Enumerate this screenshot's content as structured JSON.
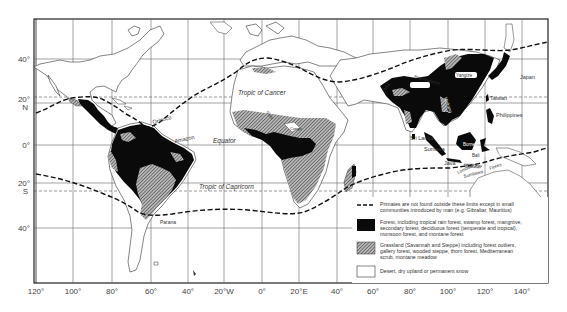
{
  "map": {
    "title": "World distribution of primates and vegetation zones",
    "colors": {
      "forest": "#0a0a0a",
      "grassland_hatch": "#8a8a8a",
      "desert": "#ffffff",
      "grid": "#555555",
      "frame": "#222222"
    },
    "lat_labels": [
      {
        "text": "40°",
        "y": 61
      },
      {
        "text": "20°",
        "y": 101
      },
      {
        "text": "N",
        "y": 109
      },
      {
        "text": "0°",
        "y": 147
      },
      {
        "text": "20°",
        "y": 185
      },
      {
        "text": "S",
        "y": 193
      },
      {
        "text": "40°",
        "y": 231
      }
    ],
    "lon_labels": [
      "120°",
      "100°",
      "80°",
      "60°",
      "40°",
      "20°W",
      "0°",
      "20°E",
      "40°",
      "60°",
      "80°",
      "100°",
      "120°",
      "140°"
    ],
    "reference_lines": {
      "tropic_of_cancer": "Tropic of Cancer",
      "equator": "Equator",
      "tropic_of_capricorn": "Tropic of Capricorn"
    },
    "place_labels": {
      "orinoco": "Orinoco",
      "amazon": "Amazon",
      "parana": "Parana",
      "niger": "Niger",
      "congo": "Congo",
      "india": "India",
      "brahmaputra": "Brahmaputra",
      "ganges": "Ganges",
      "yangtze": "Yangtze",
      "mekong": "Mekong",
      "japan": "Japan",
      "taiwan": "Taiwan",
      "philippines": "Philippines",
      "sri_lanka": "Sri Lanka",
      "sumatra": "Sumatra",
      "borneo": "Borneo",
      "java": "Java",
      "bali": "Bali",
      "sulawesi": "Sulawesi",
      "lombok": "Lombok",
      "sumbawa": "Sumbawa",
      "flores": "Flores"
    }
  },
  "legend": {
    "items": [
      {
        "symbol": "dashed-line",
        "text_line1": "Primates are not found outside these limits except in small",
        "text_line2": "communities introduced by man (e.g. Gibraltar, Mauritius)",
        "text_line3": ""
      },
      {
        "symbol": "black-fill",
        "text_line1": "Forest, including tropical rain forest, swamp forest, mangrove,",
        "text_line2": "secondary forest, deciduous forest (temperate and tropical),",
        "text_line3": "monsoon forest, and montane forest"
      },
      {
        "symbol": "hatched-fill",
        "text_line1": "Grassland (Savannah and Steppe) including forest outliers,",
        "text_line2": "gallery forest, wooded steppe, thorn forest, Mediterranean",
        "text_line3": "scrub, montane meadow"
      },
      {
        "symbol": "white-fill",
        "text_line1": "Desert, dry upland or permanent snow",
        "text_line2": "",
        "text_line3": ""
      }
    ]
  }
}
